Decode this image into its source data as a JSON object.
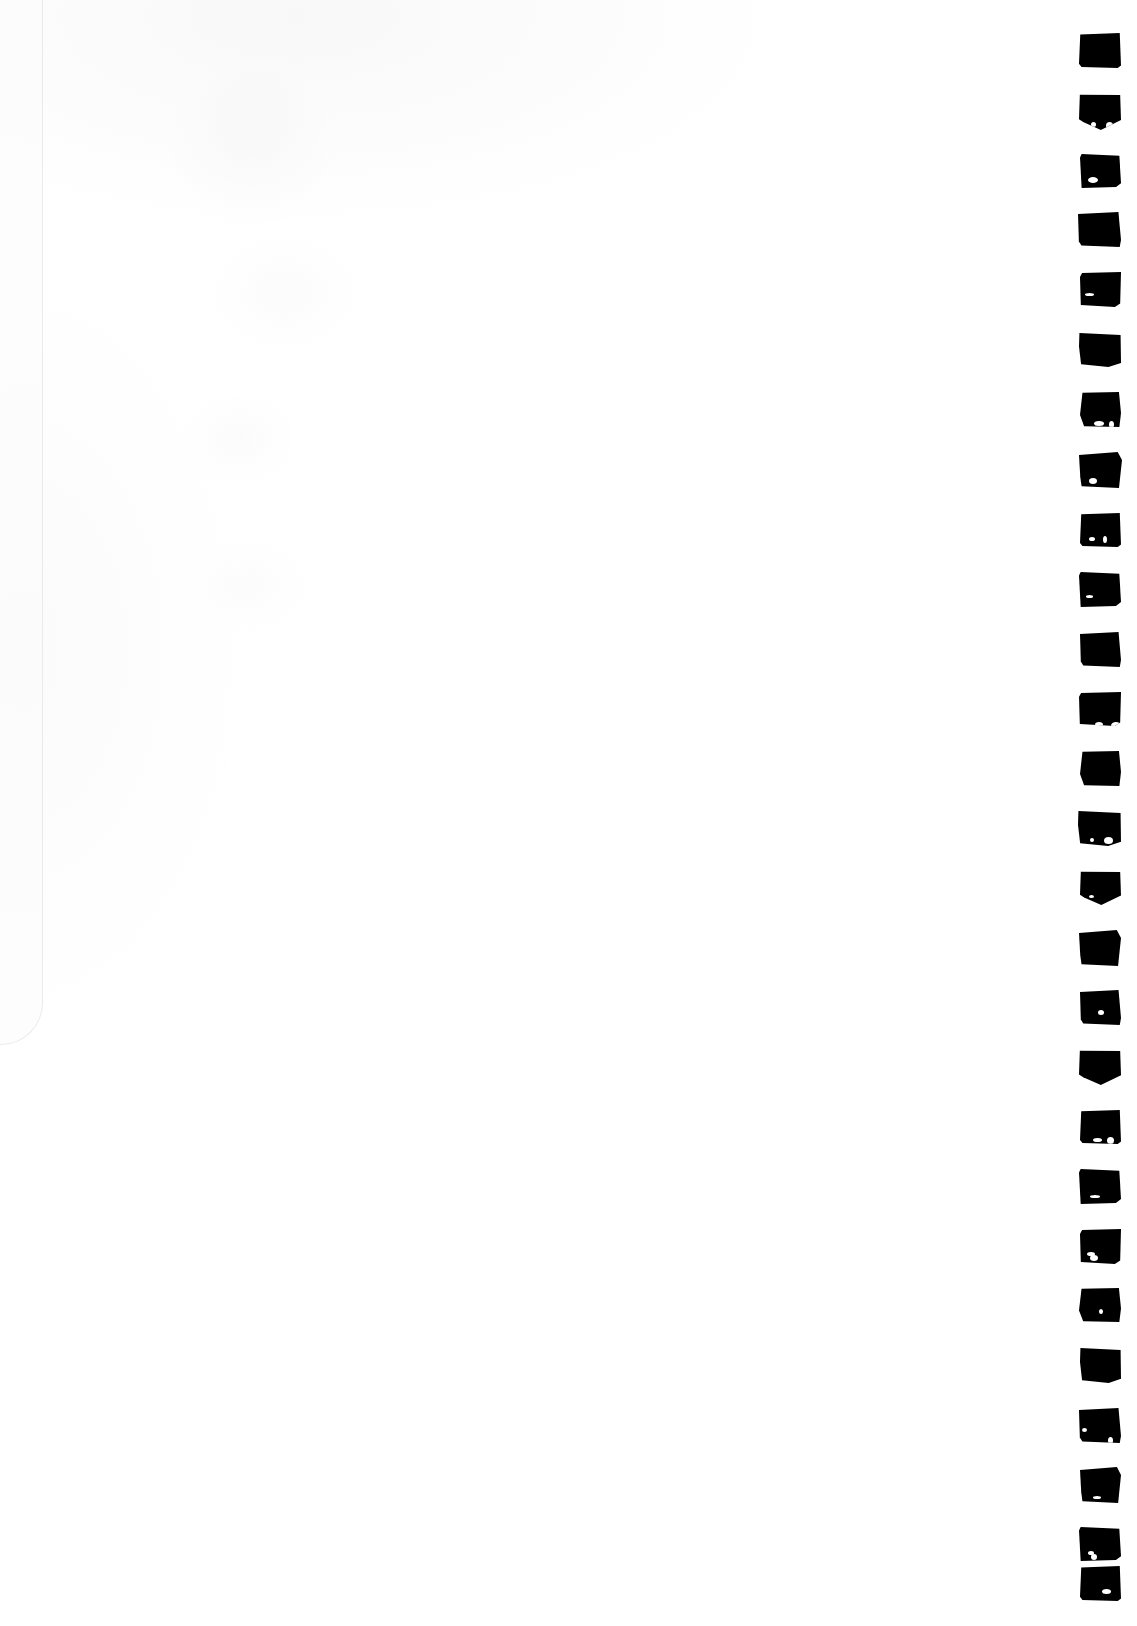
{
  "document": {
    "kind": "scanned-page",
    "title": "Scanned blank page with margin marks",
    "page_width": 1137,
    "page_height": 1626,
    "background_color": "#ffffff",
    "ink_color": "#000000",
    "description": "A blank white scanned sheet. A single vertical column of hand-inked solid black square marks runs down the right-hand margin."
  },
  "marks": {
    "count": 27,
    "shape": "filled-square",
    "color": "#000000",
    "column_left": 1079,
    "column_width": 42,
    "first_top": 33,
    "vertical_pitch": 59.2,
    "items": [
      {
        "index": 1,
        "top": 33,
        "left": 1079,
        "width": 42,
        "height": 35,
        "variant": "v0"
      },
      {
        "index": 2,
        "top": 94,
        "left": 1079,
        "width": 42,
        "height": 36,
        "variant": "v1"
      },
      {
        "index": 3,
        "top": 154,
        "left": 1080,
        "width": 41,
        "height": 34,
        "variant": "v2"
      },
      {
        "index": 4,
        "top": 212,
        "left": 1078,
        "width": 43,
        "height": 35,
        "variant": "v3"
      },
      {
        "index": 5,
        "top": 272,
        "left": 1080,
        "width": 41,
        "height": 35,
        "variant": "v4"
      },
      {
        "index": 6,
        "top": 333,
        "left": 1079,
        "width": 42,
        "height": 34,
        "variant": "v5"
      },
      {
        "index": 7,
        "top": 392,
        "left": 1080,
        "width": 41,
        "height": 35,
        "variant": "v6"
      },
      {
        "index": 8,
        "top": 452,
        "left": 1079,
        "width": 43,
        "height": 36,
        "variant": "v7"
      },
      {
        "index": 9,
        "top": 513,
        "left": 1080,
        "width": 41,
        "height": 34,
        "variant": "v0"
      },
      {
        "index": 10,
        "top": 572,
        "left": 1079,
        "width": 42,
        "height": 35,
        "variant": "v2"
      },
      {
        "index": 11,
        "top": 632,
        "left": 1080,
        "width": 41,
        "height": 35,
        "variant": "v3"
      },
      {
        "index": 12,
        "top": 692,
        "left": 1079,
        "width": 42,
        "height": 34,
        "variant": "v4"
      },
      {
        "index": 13,
        "top": 751,
        "left": 1080,
        "width": 41,
        "height": 35,
        "variant": "v6"
      },
      {
        "index": 14,
        "top": 811,
        "left": 1078,
        "width": 43,
        "height": 35,
        "variant": "v5"
      },
      {
        "index": 15,
        "top": 871,
        "left": 1080,
        "width": 41,
        "height": 34,
        "variant": "v1"
      },
      {
        "index": 16,
        "top": 930,
        "left": 1079,
        "width": 42,
        "height": 36,
        "variant": "v7"
      },
      {
        "index": 17,
        "top": 990,
        "left": 1080,
        "width": 41,
        "height": 35,
        "variant": "v3"
      },
      {
        "index": 18,
        "top": 1050,
        "left": 1079,
        "width": 42,
        "height": 35,
        "variant": "v1"
      },
      {
        "index": 19,
        "top": 1110,
        "left": 1080,
        "width": 41,
        "height": 34,
        "variant": "v0"
      },
      {
        "index": 20,
        "top": 1169,
        "left": 1079,
        "width": 42,
        "height": 35,
        "variant": "v2"
      },
      {
        "index": 21,
        "top": 1229,
        "left": 1080,
        "width": 41,
        "height": 35,
        "variant": "v4"
      },
      {
        "index": 22,
        "top": 1288,
        "left": 1079,
        "width": 42,
        "height": 34,
        "variant": "v6"
      },
      {
        "index": 23,
        "top": 1348,
        "left": 1080,
        "width": 41,
        "height": 35,
        "variant": "v5"
      },
      {
        "index": 24,
        "top": 1408,
        "left": 1079,
        "width": 42,
        "height": 35,
        "variant": "v3"
      },
      {
        "index": 25,
        "top": 1467,
        "left": 1080,
        "width": 41,
        "height": 36,
        "variant": "v7"
      },
      {
        "index": 26,
        "top": 1527,
        "left": 1079,
        "width": 42,
        "height": 34,
        "variant": "v2"
      },
      {
        "index": 27,
        "top": 1566,
        "left": 1080,
        "width": 41,
        "height": 35,
        "variant": "v0"
      }
    ]
  },
  "page_body": {
    "content_text": ""
  }
}
